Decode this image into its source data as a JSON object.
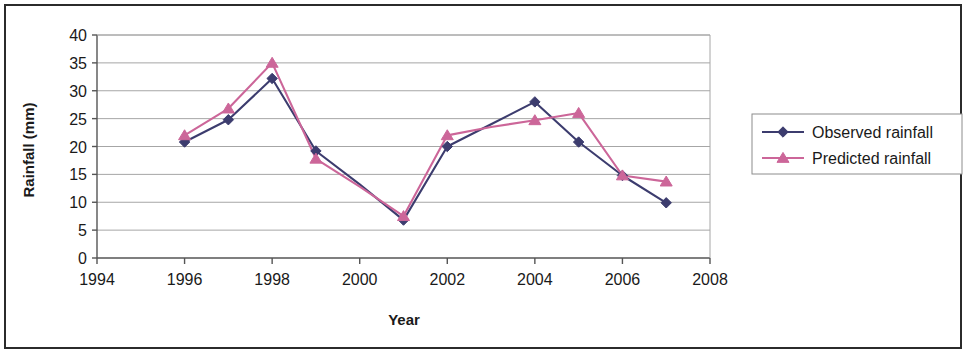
{
  "chart_data": {
    "type": "line",
    "title": "",
    "xlabel": "Year",
    "ylabel": "Rainfall (mm)",
    "xlim": [
      1994,
      2008
    ],
    "ylim": [
      0,
      40
    ],
    "xticks": [
      1994,
      1996,
      1998,
      2000,
      2002,
      2004,
      2006,
      2008
    ],
    "xtick_labels": [
      "1994",
      "1996",
      "1998",
      "2000",
      "2002",
      "2004",
      "2006",
      "2008"
    ],
    "yticks": [
      0,
      5,
      10,
      15,
      20,
      25,
      30,
      35,
      40
    ],
    "ytick_labels": [
      "0",
      "5",
      "10",
      "15",
      "20",
      "25",
      "30",
      "35",
      "40"
    ],
    "grid": "horizontal",
    "legend_position": "right",
    "x": [
      1996,
      1997,
      1998,
      1999,
      2000,
      2001,
      2002,
      2003,
      2004,
      2005,
      2006,
      2007
    ],
    "series": [
      {
        "name": "Observed rainfall",
        "color": "#3c3c6e",
        "marker": "diamond",
        "values": [
          20.8,
          24.8,
          32.2,
          19.2,
          13.2,
          6.8,
          20.0,
          24.0,
          28.0,
          20.8,
          14.8,
          9.9
        ]
      },
      {
        "name": "Predicted rainfall",
        "color": "#cc6699",
        "marker": "triangle",
        "values": [
          22.0,
          26.8,
          35.0,
          17.8,
          12.8,
          7.5,
          22.0,
          23.5,
          24.7,
          26.0,
          14.8,
          13.7
        ]
      }
    ],
    "series_gaps": {
      "2000": "interpolated",
      "2003": "interpolated"
    },
    "plotted_points": [
      {
        "year": 1996,
        "observed": 20.8,
        "predicted": 22.0
      },
      {
        "year": 1997,
        "observed": 24.8,
        "predicted": 26.8
      },
      {
        "year": 1998,
        "observed": 32.2,
        "predicted": 35.0
      },
      {
        "year": 1999,
        "observed": 19.2,
        "predicted": 17.8
      },
      {
        "year": 2001,
        "observed": 6.8,
        "predicted": 7.5
      },
      {
        "year": 2002,
        "observed": 20.0,
        "predicted": 22.0
      },
      {
        "year": 2004,
        "observed": 28.0,
        "predicted": 24.7
      },
      {
        "year": 2005,
        "observed": 20.8,
        "predicted": 26.0
      },
      {
        "year": 2006,
        "observed": 14.8,
        "predicted": 14.8
      },
      {
        "year": 2007,
        "observed": 9.9,
        "predicted": 13.7
      }
    ]
  },
  "legend": {
    "entries": [
      {
        "label": "Observed rainfall",
        "color": "#3c3c6e",
        "marker": "diamond"
      },
      {
        "label": "Predicted rainfall",
        "color": "#cc6699",
        "marker": "triangle"
      }
    ]
  },
  "colors": {
    "observed": "#3c3c6e",
    "predicted": "#cc6699",
    "axis": "#808080",
    "grid": "#a6a6a6",
    "frame": "#2b2b2b",
    "text": "#1a1a1a"
  }
}
